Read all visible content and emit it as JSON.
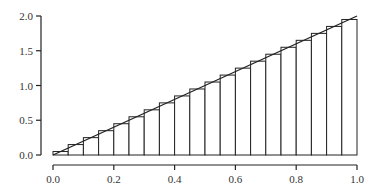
{
  "chart_data": {
    "type": "bar",
    "title": "",
    "xlabel": "",
    "ylabel": "",
    "function": {
      "name": "f(x) = 2x",
      "x": [
        0.0,
        1.0
      ],
      "y": [
        0.0,
        2.0
      ]
    },
    "bins": 20,
    "bin_width": 0.05,
    "x_left_edges": [
      0.0,
      0.05,
      0.1,
      0.15,
      0.2,
      0.25,
      0.3,
      0.35,
      0.4,
      0.45,
      0.5,
      0.55,
      0.6,
      0.65,
      0.7,
      0.75,
      0.8,
      0.85,
      0.9,
      0.95
    ],
    "values": [
      0.05,
      0.15,
      0.25,
      0.35,
      0.45,
      0.55,
      0.65,
      0.75,
      0.85,
      0.95,
      1.05,
      1.15,
      1.25,
      1.35,
      1.45,
      1.55,
      1.65,
      1.75,
      1.85,
      1.95
    ],
    "xlim": [
      0.0,
      1.0
    ],
    "ylim": [
      0.0,
      2.0
    ],
    "x_ticks": [
      0.0,
      0.2,
      0.4,
      0.6,
      0.8,
      1.0
    ],
    "x_tick_labels": [
      "0.0",
      "0.2",
      "0.4",
      "0.6",
      "0.8",
      "1.0"
    ],
    "y_ticks": [
      0.0,
      0.5,
      1.0,
      1.5,
      2.0
    ],
    "y_tick_labels": [
      "0.0",
      "0.5",
      "1.0",
      "1.5",
      "2.0"
    ],
    "grid": false,
    "legend": null
  },
  "colors": {
    "stroke": "#222222",
    "bar_fill": "#ffffff",
    "background": "#ffffff"
  }
}
